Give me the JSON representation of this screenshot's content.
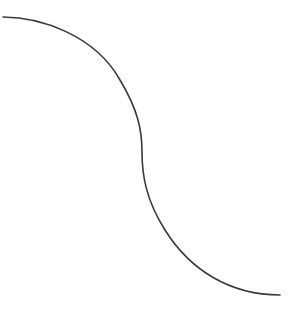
{
  "diagram": {
    "type": "s-curve",
    "stroke_color": "#3a3a3a",
    "background": "#ffffff",
    "start_point": [
      3,
      17
    ],
    "inflection_point": [
      142,
      152
    ],
    "end_point": [
      280,
      295
    ]
  }
}
